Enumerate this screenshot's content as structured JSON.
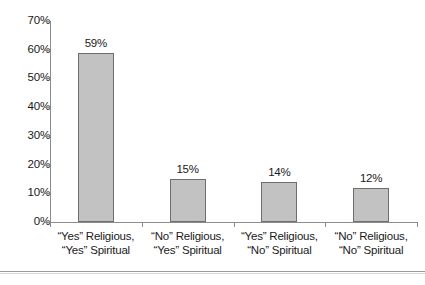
{
  "chart_data": {
    "type": "bar",
    "title": "",
    "subtitle": "",
    "xlabel": "",
    "ylabel": "",
    "categories": [
      "“Yes” Religious, “Yes” Spiritual",
      "“No” Religious, “Yes” Spiritual",
      "“Yes” Religious, “No” Spiritual",
      "“No” Religious, “No” Spiritual"
    ],
    "category_lines": [
      [
        "“Yes” Religious,",
        "“Yes” Spiritual"
      ],
      [
        "“No” Religious,",
        "“Yes” Spiritual"
      ],
      [
        "“Yes” Religious,",
        "“No” Spiritual"
      ],
      [
        "“No” Religious,",
        "“No” Spiritual"
      ]
    ],
    "values": [
      59,
      15,
      14,
      12
    ],
    "data_labels": [
      "59%",
      "15%",
      "14%",
      "12%"
    ],
    "ylim": [
      0,
      70
    ],
    "ytick_values": [
      0,
      10,
      20,
      30,
      40,
      50,
      60,
      70
    ],
    "ytick_labels": [
      "0%",
      "10%",
      "20%",
      "30%",
      "40%",
      "50%",
      "60%",
      "70%"
    ],
    "grid": false,
    "legend": false,
    "legend_position": "none",
    "bar_fill_color": "#c2c2c2",
    "bar_border_color": "#6e6e6e",
    "axis_color": "#8c8c8c",
    "text_color": "#1a1a1a"
  },
  "footer": {
    "caption": "",
    "rule_color": "#9a9a9a"
  }
}
